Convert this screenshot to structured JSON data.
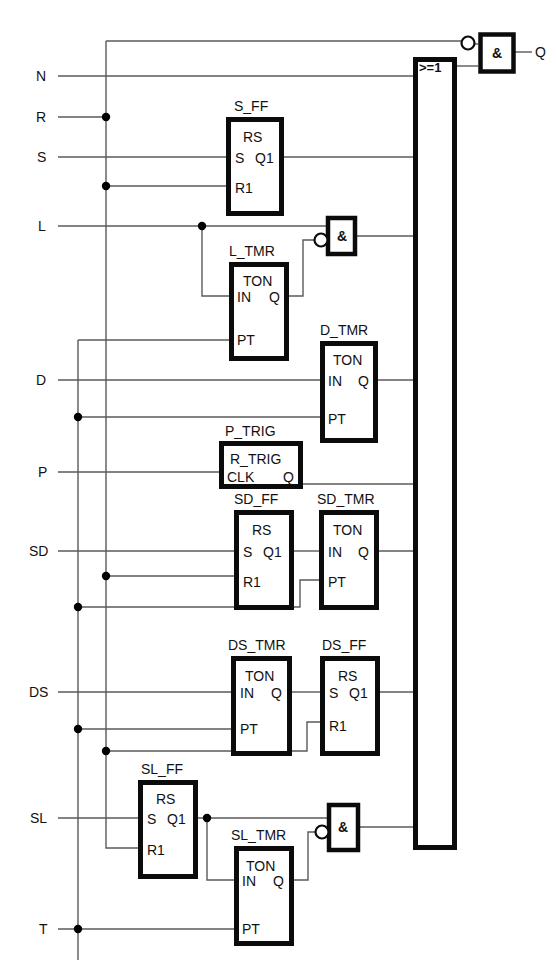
{
  "diagram": {
    "kind": "function-block-logic-diagram",
    "title": "",
    "inputs": [
      {
        "name": "N",
        "x": 40,
        "y": 76
      },
      {
        "name": "R",
        "x": 40,
        "y": 117
      },
      {
        "name": "S",
        "x": 40,
        "y": 157
      },
      {
        "name": "L",
        "x": 40,
        "y": 226
      },
      {
        "name": "D",
        "x": 40,
        "y": 380
      },
      {
        "name": "P",
        "x": 40,
        "y": 472
      },
      {
        "name": "SD",
        "x": 33,
        "y": 551
      },
      {
        "name": "DS",
        "x": 33,
        "y": 692
      },
      {
        "name": "SL",
        "x": 33,
        "y": 818
      },
      {
        "name": "T",
        "x": 40,
        "y": 929
      }
    ],
    "outputs": [
      {
        "name": "Q",
        "x": 540,
        "y": 52
      }
    ],
    "blocks": [
      {
        "id": "S_FF",
        "label": "S_FF",
        "type": "RS",
        "pins_in": [
          "S",
          "R1"
        ],
        "pins_out": [
          "Q1"
        ],
        "x": 226,
        "y": 117,
        "w": 57,
        "h": 98
      },
      {
        "id": "L_TMR",
        "label": "L_TMR",
        "type": "TON",
        "pins_in": [
          "IN",
          "PT"
        ],
        "pins_out": [
          "Q"
        ],
        "x": 229,
        "y": 262,
        "w": 59,
        "h": 98
      },
      {
        "id": "D_TMR",
        "label": "D_TMR",
        "type": "TON",
        "pins_in": [
          "IN",
          "PT"
        ],
        "pins_out": [
          "Q"
        ],
        "x": 320,
        "y": 341,
        "w": 58,
        "h": 102
      },
      {
        "id": "P_TRIG",
        "label": "P_TRIG",
        "type": "R_TRIG",
        "pins_in": [
          "CLK"
        ],
        "pins_out": [
          "Q"
        ],
        "x": 219,
        "y": 441,
        "w": 84,
        "h": 48
      },
      {
        "id": "SD_FF",
        "label": "SD_FF",
        "type": "RS",
        "pins_in": [
          "S",
          "R1"
        ],
        "pins_out": [
          "Q1"
        ],
        "x": 234,
        "y": 510,
        "w": 59,
        "h": 99
      },
      {
        "id": "SD_TMR",
        "label": "SD_TMR",
        "type": "TON",
        "pins_in": [
          "IN",
          "PT"
        ],
        "pins_out": [
          "Q"
        ],
        "x": 319,
        "y": 510,
        "w": 60,
        "h": 99
      },
      {
        "id": "DS_TMR",
        "label": "DS_TMR",
        "type": "TON",
        "pins_in": [
          "IN",
          "PT"
        ],
        "pins_out": [
          "Q"
        ],
        "x": 231,
        "y": 656,
        "w": 61,
        "h": 99
      },
      {
        "id": "DS_FF",
        "label": "DS_FF",
        "type": "RS",
        "pins_in": [
          "S",
          "R1"
        ],
        "pins_out": [
          "Q1"
        ],
        "x": 320,
        "y": 656,
        "w": 60,
        "h": 99
      },
      {
        "id": "SL_FF",
        "label": "SL_FF",
        "type": "RS",
        "pins_in": [
          "S",
          "R1"
        ],
        "pins_out": [
          "Q1"
        ],
        "x": 138,
        "y": 780,
        "w": 59,
        "h": 98
      },
      {
        "id": "SL_TMR",
        "label": "SL_TMR",
        "type": "TON",
        "pins_in": [
          "IN",
          "PT"
        ],
        "pins_out": [
          "Q"
        ],
        "x": 234,
        "y": 846,
        "w": 59,
        "h": 99
      }
    ],
    "gates": [
      {
        "id": "and-top",
        "symbol": "&",
        "x": 478,
        "y": 32,
        "w": 37,
        "h": 41,
        "inverted_input": true
      },
      {
        "id": "and-L",
        "symbol": "&",
        "x": 326,
        "y": 216,
        "w": 30,
        "h": 39,
        "inverted_input": true
      },
      {
        "id": "and-SL",
        "symbol": "&",
        "x": 327,
        "y": 803,
        "w": 33,
        "h": 49,
        "inverted_input": true
      },
      {
        "id": "or-main",
        "symbol": ">=1",
        "x": 413,
        "y": 57,
        "w": 43,
        "h": 793,
        "inverted_input": false
      }
    ],
    "or_inputs_y": [
      76,
      157,
      236,
      384,
      553,
      694,
      827
    ],
    "junction_dots": [
      {
        "x": 106,
        "y": 117
      },
      {
        "x": 106,
        "y": 186
      },
      {
        "x": 78,
        "y": 417
      },
      {
        "x": 106,
        "y": 576
      },
      {
        "x": 78,
        "y": 607
      },
      {
        "x": 78,
        "y": 729
      },
      {
        "x": 106,
        "y": 751
      },
      {
        "x": 78,
        "y": 929
      },
      {
        "x": 202,
        "y": 226
      },
      {
        "x": 207,
        "y": 818
      }
    ],
    "bus_lines": [
      {
        "id": "bus-R",
        "x": 106,
        "y1": 117,
        "y2": 760
      },
      {
        "id": "bus-T",
        "x": 78,
        "y1": 340,
        "y2": 960
      }
    ],
    "colors": {
      "block_stroke": "#0b0b0b",
      "wire": "#5a5a5a",
      "background": "#ffffff",
      "text": "#111111"
    }
  }
}
